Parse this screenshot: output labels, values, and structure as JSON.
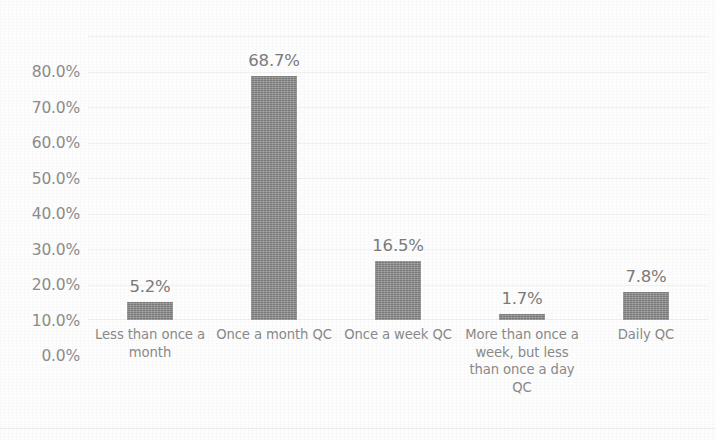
{
  "chart_data": {
    "type": "bar",
    "title": "",
    "subtitle": "",
    "xlabel": "",
    "ylabel": "",
    "ylim": [
      0,
      80
    ],
    "grid": true,
    "legend": false,
    "legend_position": "none",
    "bar_color": "#8a8a8a",
    "text_color": "#8a8a8a",
    "value_suffix": "%",
    "categories": [
      "Less than once a month",
      "Once a month QC",
      "Once a week QC",
      "More than once a week, but less than once a day QC",
      "Daily QC"
    ],
    "values": [
      5.2,
      68.7,
      16.5,
      1.7,
      7.8
    ],
    "data_labels": [
      "5.2%",
      "68.7%",
      "16.5%",
      "1.7%",
      "7.8%"
    ],
    "yticks": [
      80,
      70,
      60,
      50,
      40,
      30,
      20,
      10,
      0
    ],
    "ytick_labels": [
      "80.0%",
      "70.0%",
      "60.0%",
      "50.0%",
      "40.0%",
      "30.0%",
      "20.0%",
      "10.0%",
      "0.0%"
    ]
  }
}
